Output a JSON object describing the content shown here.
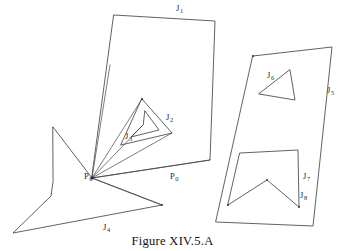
{
  "figure": {
    "caption": "Figure XIV.5.A",
    "stroke_color": "#3a3a3a",
    "background_color": "#ffffff",
    "width": 345,
    "height": 251
  },
  "labels": [
    {
      "name": "label-J1",
      "base": "J",
      "sub": "1",
      "x": 176,
      "y": 4
    },
    {
      "name": "label-J2",
      "base": "J",
      "sub": "2",
      "x": 166,
      "y": 113
    },
    {
      "name": "label-J3",
      "base": "J",
      "sub": "3",
      "x": 125,
      "y": 132
    },
    {
      "name": "label-J4",
      "base": "J",
      "sub": "4",
      "x": 103,
      "y": 223
    },
    {
      "name": "label-J5",
      "base": "J",
      "sub": "5",
      "x": 327,
      "y": 86
    },
    {
      "name": "label-J6",
      "base": "J",
      "sub": "6",
      "x": 267,
      "y": 71
    },
    {
      "name": "label-J7",
      "base": "J",
      "sub": "7",
      "x": 303,
      "y": 172
    },
    {
      "name": "label-J8",
      "base": "J",
      "sub": "8",
      "x": 300,
      "y": 191
    },
    {
      "name": "label-P6",
      "base": "P",
      "sub": "6",
      "x": 84,
      "y": 172
    },
    {
      "name": "label-P0",
      "base": "P",
      "sub": "0",
      "x": 170,
      "y": 172
    }
  ],
  "shapes": [
    {
      "name": "outer-quadrilateral-J1",
      "kind": "polygon",
      "closed": true,
      "points": [
        [
          114,
          15
        ],
        [
          215,
          21
        ],
        [
          210,
          160
        ],
        [
          92,
          178
        ]
      ]
    },
    {
      "name": "triangle-J2",
      "kind": "polygon",
      "closed": true,
      "points": [
        [
          142,
          99
        ],
        [
          172,
          133
        ],
        [
          121,
          145
        ]
      ]
    },
    {
      "name": "inner-arrow-J3",
      "kind": "polygon",
      "closed": true,
      "points": [
        [
          145,
          111
        ],
        [
          159,
          130
        ],
        [
          131,
          137
        ],
        [
          143,
          125
        ]
      ]
    },
    {
      "name": "star-polygon-J4",
      "kind": "polygon",
      "closed": true,
      "points": [
        [
          53,
          127
        ],
        [
          92,
          178
        ],
        [
          162,
          205
        ],
        [
          13,
          233
        ],
        [
          51,
          196
        ],
        [
          53,
          182
        ]
      ]
    },
    {
      "name": "right-quadrilateral-J5",
      "kind": "polygon",
      "closed": true,
      "points": [
        [
          253,
          56
        ],
        [
          332,
          47
        ],
        [
          313,
          226
        ],
        [
          216,
          222
        ]
      ]
    },
    {
      "name": "triangle-J6",
      "kind": "polygon",
      "closed": true,
      "points": [
        [
          290,
          70
        ],
        [
          295,
          100
        ],
        [
          259,
          94
        ]
      ]
    },
    {
      "name": "notched-polygon-J7-J8",
      "kind": "polygon",
      "closed": true,
      "points": [
        [
          240,
          153
        ],
        [
          298,
          150
        ],
        [
          299,
          207
        ],
        [
          267,
          180
        ],
        [
          228,
          205
        ]
      ]
    }
  ],
  "rays": [
    {
      "name": "ray-P6-to-J1-left-edge",
      "points": [
        [
          92,
          178
        ],
        [
          110,
          65
        ]
      ]
    },
    {
      "name": "ray-P6-to-triangle-apex",
      "points": [
        [
          92,
          178
        ],
        [
          142,
          99
        ]
      ]
    },
    {
      "name": "ray-P6-to-arrow-notch",
      "points": [
        [
          92,
          178
        ],
        [
          143,
          125
        ]
      ]
    },
    {
      "name": "ray-P6-to-triangle-right",
      "points": [
        [
          92,
          178
        ],
        [
          172,
          133
        ]
      ]
    },
    {
      "name": "ray-P6-to-quad-corner",
      "points": [
        [
          92,
          178
        ],
        [
          210,
          160
        ]
      ]
    },
    {
      "name": "ray-P6-to-star-tip",
      "points": [
        [
          92,
          178
        ],
        [
          162,
          205
        ]
      ]
    }
  ],
  "vertices": [
    {
      "name": "vertex-P6",
      "x": 92,
      "y": 178,
      "r": 1.6
    },
    {
      "name": "vertex-triangle-J2-apex",
      "x": 142,
      "y": 99,
      "r": 0.9
    },
    {
      "name": "vertex-notch-peak",
      "x": 267,
      "y": 180,
      "r": 0.9
    },
    {
      "name": "vertex-notch-bottom-left",
      "x": 228,
      "y": 205,
      "r": 0.9
    },
    {
      "name": "vertex-notch-bottom-right",
      "x": 299,
      "y": 207,
      "r": 0.9
    },
    {
      "name": "vertex-star-right-tip",
      "x": 162,
      "y": 205,
      "r": 0.9
    },
    {
      "name": "vertex-right-quad-topleft",
      "x": 253,
      "y": 56,
      "r": 0.9
    }
  ]
}
